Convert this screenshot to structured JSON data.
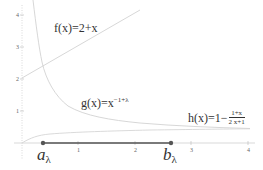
{
  "diagram": {
    "axes": {
      "x_ticks": [
        "1",
        "2",
        "3",
        "4"
      ],
      "y_ticks": [
        "1",
        "2",
        "3",
        "4"
      ],
      "xlim": [
        0,
        4
      ],
      "ylim": [
        0,
        4
      ]
    },
    "functions": {
      "f": {
        "label": "f(x)=2+x"
      },
      "g": {
        "label_base": "g(x)=x",
        "label_exp": "−1+λ"
      },
      "h": {
        "label_base": "h(x)=1−",
        "label_num": "1+x",
        "label_den": "2 x+1"
      }
    },
    "points": {
      "a": {
        "letter": "a",
        "subscript": "λ"
      },
      "b": {
        "letter": "b",
        "subscript": "λ"
      }
    },
    "colors": {
      "curve": "#d0d0d0",
      "interval": "#555555",
      "axis": "#cccccc"
    }
  }
}
